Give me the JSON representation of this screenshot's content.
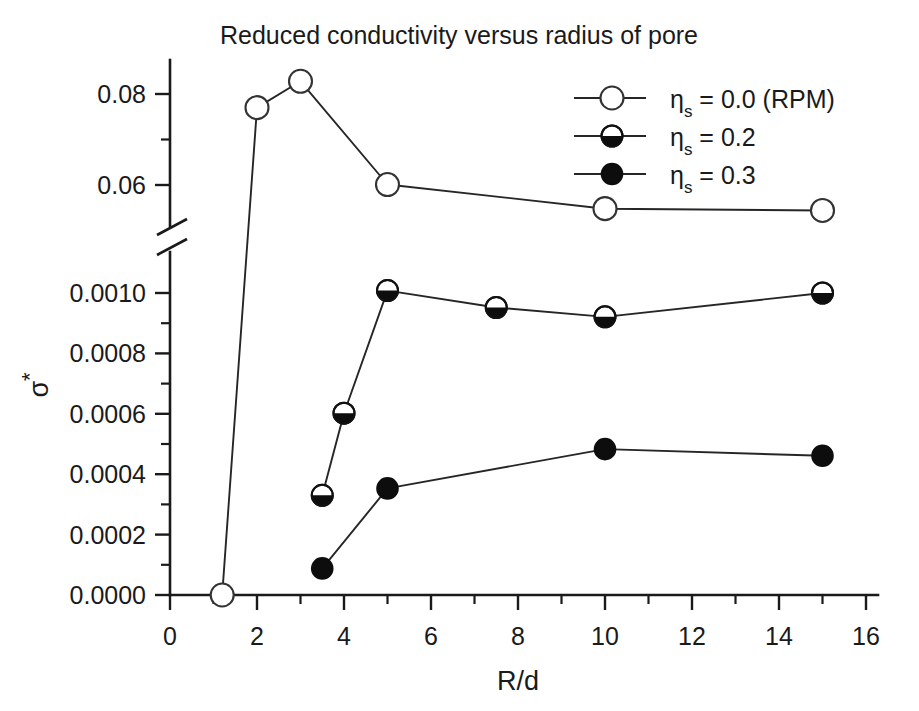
{
  "chart_data": {
    "type": "line",
    "title": "Reduced conductivity versus radius of pore",
    "xlabel": "R/d",
    "ylabel": "σ*",
    "xlim": [
      0,
      17
    ],
    "xticks": [
      0,
      2,
      4,
      6,
      8,
      10,
      12,
      14,
      16
    ],
    "xtick_labels": [
      "0",
      "2",
      "4",
      "6",
      "8",
      "10",
      "12",
      "14",
      "16"
    ],
    "x_minor_ticks": [
      1,
      3,
      5,
      7,
      9,
      11,
      13,
      15
    ],
    "grid": false,
    "broken_axis": true,
    "y_axis_note": "y-axis is broken between 0.0010 and 0.06",
    "y_lower_segment": {
      "ticks": [
        0.0,
        0.0002,
        0.0004,
        0.0006,
        0.0008,
        0.001
      ],
      "tick_labels": [
        "0.0000",
        "0.0002",
        "0.0004",
        "0.0006",
        "0.0008",
        "0.0010"
      ],
      "minor_ticks": [
        0.0001,
        0.0003,
        0.0005,
        0.0007,
        0.0009
      ]
    },
    "y_upper_segment": {
      "ticks": [
        0.06,
        0.08
      ],
      "tick_labels": [
        "0.06",
        "0.08"
      ],
      "minor_ticks": [
        0.05,
        0.07
      ]
    },
    "legend_position": "top-right",
    "series": [
      {
        "name": "ηs = 0.0 (RPM)",
        "eta_symbol": "η",
        "eta_sub": "s",
        "eta_value": "= 0.0 (RPM)",
        "marker": "open-circle",
        "segment": "upper",
        "points": [
          {
            "x": 1.2,
            "y": 0.0
          },
          {
            "x": 2.0,
            "y": 0.077
          },
          {
            "x": 3.0,
            "y": 0.0828
          },
          {
            "x": 5.0,
            "y": 0.0601
          },
          {
            "x": 10.0,
            "y": 0.0548
          },
          {
            "x": 15.0,
            "y": 0.0544
          }
        ]
      },
      {
        "name": "ηs = 0.2",
        "eta_symbol": "η",
        "eta_sub": "s",
        "eta_value": "= 0.2",
        "marker": "half-filled-circle",
        "segment": "lower",
        "points": [
          {
            "x": 3.5,
            "y": 0.00033
          },
          {
            "x": 4.0,
            "y": 0.000602
          },
          {
            "x": 5.0,
            "y": 0.001008
          },
          {
            "x": 7.5,
            "y": 0.000952
          },
          {
            "x": 10.0,
            "y": 0.000921
          },
          {
            "x": 15.0,
            "y": 0.001
          }
        ]
      },
      {
        "name": "ηs = 0.3",
        "eta_symbol": "η",
        "eta_sub": "s",
        "eta_value": "= 0.3",
        "marker": "filled-circle",
        "segment": "lower",
        "points": [
          {
            "x": 3.5,
            "y": 8.8e-05
          },
          {
            "x": 5.0,
            "y": 0.000353
          },
          {
            "x": 10.0,
            "y": 0.000483
          },
          {
            "x": 15.0,
            "y": 0.000461
          }
        ]
      }
    ]
  }
}
